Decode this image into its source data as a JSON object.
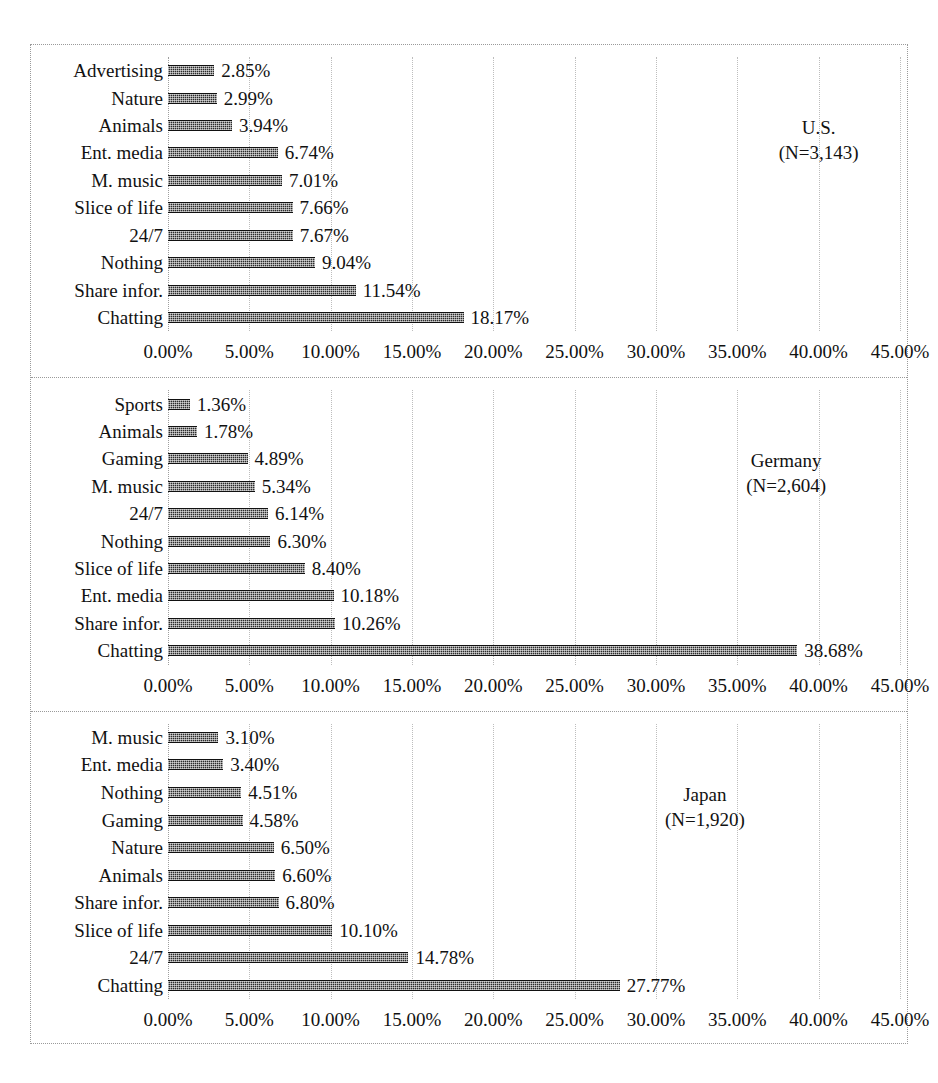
{
  "chart_data": {
    "type": "bar",
    "orientation": "horizontal",
    "title": "",
    "xlabel": "",
    "ylabel": "",
    "xlim": [
      0,
      45
    ],
    "xticks": [
      "0.00%",
      "5.00%",
      "10.00%",
      "15.00%",
      "20.00%",
      "25.00%",
      "30.00%",
      "35.00%",
      "40.00%",
      "45.00%"
    ],
    "xtick_values": [
      0,
      5,
      10,
      15,
      20,
      25,
      30,
      35,
      40,
      45
    ],
    "grid": true,
    "legend": "none",
    "bar_color": "#2b2b2b",
    "panels": [
      {
        "country": "U.S.",
        "n_label": "(N=3,143)",
        "categories": [
          "Advertising",
          "Nature",
          "Animals",
          "Ent. media",
          "M. music",
          "Slice of life",
          "24/7",
          "Nothing",
          "Share infor.",
          "Chatting"
        ],
        "values": [
          2.85,
          2.99,
          3.94,
          6.74,
          7.01,
          7.66,
          7.67,
          9.04,
          11.54,
          18.17
        ],
        "value_labels": [
          "2.85%",
          "2.99%",
          "3.94%",
          "6.74%",
          "7.01%",
          "7.66%",
          "7.67%",
          "9.04%",
          "11.54%",
          "18.17%"
        ]
      },
      {
        "country": "Germany",
        "n_label": "(N=2,604)",
        "categories": [
          "Sports",
          "Animals",
          "Gaming",
          "M. music",
          "24/7",
          "Nothing",
          "Slice of life",
          "Ent. media",
          "Share infor.",
          "Chatting"
        ],
        "values": [
          1.36,
          1.78,
          4.89,
          5.34,
          6.14,
          6.3,
          8.4,
          10.18,
          10.26,
          38.68
        ],
        "value_labels": [
          "1.36%",
          "1.78%",
          "4.89%",
          "5.34%",
          "6.14%",
          "6.30%",
          "8.40%",
          "10.18%",
          "10.26%",
          "38.68%"
        ]
      },
      {
        "country": "Japan",
        "n_label": "(N=1,920)",
        "categories": [
          "M. music",
          "Ent. media",
          "Nothing",
          "Gaming",
          "Nature",
          "Animals",
          "Share infor.",
          "Slice of life",
          "24/7",
          "Chatting"
        ],
        "values": [
          3.1,
          3.4,
          4.51,
          4.58,
          6.5,
          6.6,
          6.8,
          10.1,
          14.78,
          27.77
        ],
        "value_labels": [
          "3.10%",
          "3.40%",
          "4.51%",
          "4.58%",
          "6.50%",
          "6.60%",
          "6.80%",
          "10.10%",
          "14.78%",
          "27.77%"
        ]
      }
    ]
  }
}
